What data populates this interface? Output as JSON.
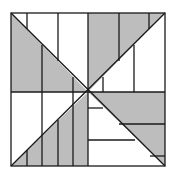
{
  "diagram": {
    "colors": {
      "shade": "#bdbdbd",
      "line": "#1a1a1a",
      "background": "#ffffff"
    }
  }
}
